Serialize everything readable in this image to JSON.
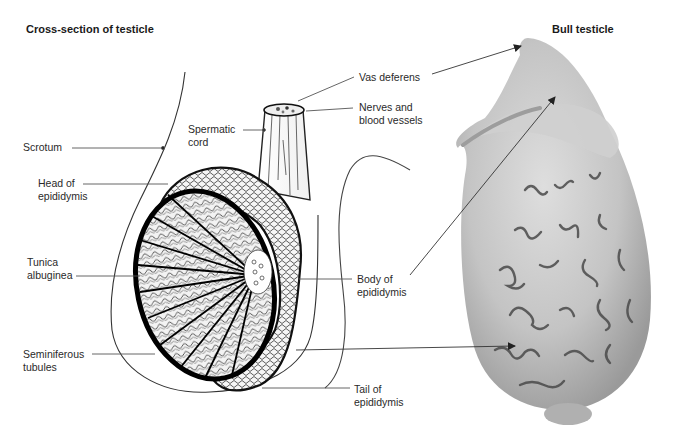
{
  "titles": {
    "left": "Cross-section of testicle",
    "right": "Bull testicle"
  },
  "labels": {
    "scrotum": {
      "line1": "Scrotum"
    },
    "spermatic_cord": {
      "line1": "Spermatic",
      "line2": "cord"
    },
    "head_of_epididymis": {
      "line1": "Head of",
      "line2": "epididymis"
    },
    "tunica_albuginea": {
      "line1": "Tunica",
      "line2": "albuginea"
    },
    "seminiferous_tubules": {
      "line1": "Seminiferous",
      "line2": "tubules"
    },
    "vas_deferens": {
      "line1": "Vas deferens"
    },
    "nerves_blood_vessels": {
      "line1": "Nerves and",
      "line2": "blood vessels"
    },
    "body_of_epididymis": {
      "line1": "Body of",
      "line2": "epididymis"
    },
    "tail_of_epididymis": {
      "line1": "Tail of",
      "line2": "epididymis"
    }
  },
  "colors": {
    "line": "#555555",
    "ink": "#111111",
    "specimen_base": "#b9b9b9",
    "specimen_light": "#d8d8d8",
    "specimen_vessel": "#4a4a4a"
  }
}
